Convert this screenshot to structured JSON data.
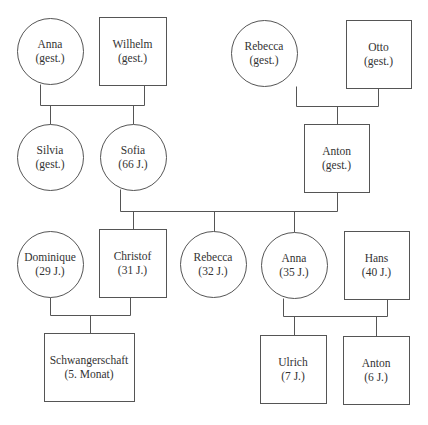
{
  "diagram": {
    "type": "genogram",
    "stroke_color": "#555555",
    "background": "#ffffff",
    "nodes": [
      {
        "id": "anna-gen1",
        "name": "Anna",
        "detail": "(gest.)",
        "shape": "circle",
        "cx": 50,
        "cy": 51,
        "r": 33
      },
      {
        "id": "wilhelm",
        "name": "Wilhelm",
        "detail": "(gest.)",
        "shape": "square",
        "x": 99,
        "y": 17,
        "w": 67,
        "h": 68
      },
      {
        "id": "rebecca-gen1",
        "name": "Rebecca",
        "detail": "(gest.)",
        "shape": "circle",
        "cx": 264,
        "cy": 53,
        "r": 33
      },
      {
        "id": "otto",
        "name": "Otto",
        "detail": "(gest.)",
        "shape": "square",
        "x": 346,
        "y": 20,
        "w": 65,
        "h": 68
      },
      {
        "id": "silvia",
        "name": "Silvia",
        "detail": "(gest.)",
        "shape": "circle",
        "cx": 50,
        "cy": 157,
        "r": 33
      },
      {
        "id": "sofia",
        "name": "Sofia",
        "detail": "(66 J.)",
        "shape": "circle",
        "cx": 133,
        "cy": 157,
        "r": 33
      },
      {
        "id": "anton-gen2",
        "name": "Anton",
        "detail": "(gest.)",
        "shape": "square",
        "x": 304,
        "y": 124,
        "w": 65,
        "h": 68
      },
      {
        "id": "dominique",
        "name": "Dominique",
        "detail": "(29 J.)",
        "shape": "circle",
        "cx": 50,
        "cy": 264,
        "r": 33
      },
      {
        "id": "christof",
        "name": "Christof",
        "detail": "(31 J.)",
        "shape": "square",
        "x": 99,
        "y": 229,
        "w": 67,
        "h": 68
      },
      {
        "id": "rebecca-gen3",
        "name": "Rebecca",
        "detail": "(32 J.)",
        "shape": "circle",
        "cx": 213,
        "cy": 264,
        "r": 33
      },
      {
        "id": "anna-gen3",
        "name": "Anna",
        "detail": "(35 J.)",
        "shape": "circle",
        "cx": 294,
        "cy": 265,
        "r": 33
      },
      {
        "id": "hans",
        "name": "Hans",
        "detail": "(40 J.)",
        "shape": "square",
        "x": 344,
        "y": 231,
        "w": 65,
        "h": 68
      },
      {
        "id": "schwangerschaft",
        "name": "Schwangerschaft",
        "detail": "(5. Monat)",
        "shape": "square",
        "x": 44,
        "y": 333,
        "w": 90,
        "h": 68
      },
      {
        "id": "ulrich",
        "name": "Ulrich",
        "detail": "(7 J.)",
        "shape": "square",
        "x": 260,
        "y": 335,
        "w": 66,
        "h": 68
      },
      {
        "id": "anton-gen4",
        "name": "Anton",
        "detail": "(6 J.)",
        "shape": "square",
        "x": 343,
        "y": 336,
        "w": 66,
        "h": 68
      }
    ],
    "connections": [
      {
        "from": [
          "anna-gen1",
          "wilhelm"
        ],
        "to": [
          "silvia",
          "sofia"
        ]
      },
      {
        "from": [
          "rebecca-gen1",
          "otto"
        ],
        "to": [
          "anton-gen2"
        ]
      },
      {
        "from": [
          "sofia",
          "anton-gen2"
        ],
        "to": [
          "christof",
          "rebecca-gen3",
          "anna-gen3"
        ]
      },
      {
        "from": [
          "dominique",
          "christof"
        ],
        "to": [
          "schwangerschaft"
        ]
      },
      {
        "from": [
          "anna-gen3",
          "hans"
        ],
        "to": [
          "ulrich",
          "anton-gen4"
        ]
      }
    ],
    "lines": [
      [
        40,
        84,
        40,
        105
      ],
      [
        144,
        85,
        144,
        105
      ],
      [
        40,
        105,
        144,
        105
      ],
      [
        50,
        105,
        50,
        124
      ],
      [
        133,
        105,
        133,
        124
      ],
      [
        296,
        86,
        296,
        106
      ],
      [
        378,
        88,
        378,
        106
      ],
      [
        296,
        106,
        378,
        106
      ],
      [
        337,
        106,
        337,
        124
      ],
      [
        120,
        189,
        120,
        211
      ],
      [
        337,
        192,
        337,
        211
      ],
      [
        120,
        211,
        337,
        211
      ],
      [
        133,
        211,
        133,
        229
      ],
      [
        214,
        211,
        214,
        231
      ],
      [
        294,
        211,
        294,
        232
      ],
      [
        50,
        297,
        50,
        315
      ],
      [
        130,
        297,
        130,
        315
      ],
      [
        50,
        315,
        130,
        315
      ],
      [
        90,
        315,
        90,
        333
      ],
      [
        283,
        298,
        283,
        316
      ],
      [
        387,
        299,
        387,
        316
      ],
      [
        283,
        316,
        387,
        316
      ],
      [
        294,
        316,
        294,
        335
      ],
      [
        376,
        316,
        376,
        336
      ]
    ]
  }
}
